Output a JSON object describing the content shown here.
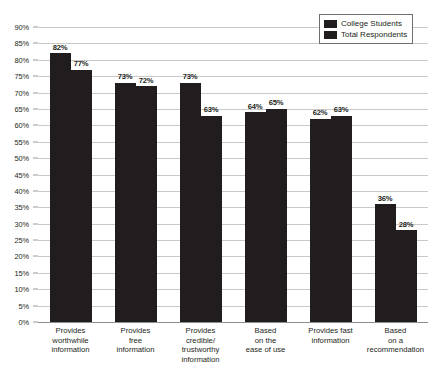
{
  "chart_data": {
    "type": "bar",
    "title": "",
    "subtitle": "",
    "xlabel": "",
    "ylabel": "",
    "ylim": [
      0,
      90
    ],
    "ytick_step": 5,
    "ytick_labels": [
      "90%",
      "85%",
      "80%",
      "75%",
      "70%",
      "65%",
      "60%",
      "55%",
      "50%",
      "45%",
      "40%",
      "35%",
      "30%",
      "25%",
      "20%",
      "15%",
      "10%",
      "5%",
      "0%"
    ],
    "grid": true,
    "legend_position": "top-right",
    "value_suffix": "%",
    "categories": [
      "Provides worthwhile information",
      "Provides free information",
      "Provides credible/ trustworthy information",
      "Based on the ease of use",
      "Provides fast information",
      "Based on a recommendation"
    ],
    "category_lines": [
      [
        "Provides",
        "worthwhile",
        "information"
      ],
      [
        "Provides",
        "free",
        "information"
      ],
      [
        "Provides",
        "credible/",
        "trustworthy",
        "information"
      ],
      [
        "Based",
        "on the",
        "ease of use"
      ],
      [
        "Provides fast",
        "information"
      ],
      [
        "Based",
        "on a",
        "recommendation"
      ]
    ],
    "series": [
      {
        "name": "College Students",
        "color": "#211d1e",
        "values": [
          82,
          73,
          73,
          64,
          62,
          36
        ],
        "labels": [
          "82%",
          "73%",
          "73%",
          "64%",
          "62%",
          "36%"
        ]
      },
      {
        "name": "Total Respondents",
        "color": "#211d1e",
        "values": [
          77,
          72,
          63,
          65,
          63,
          28
        ],
        "labels": [
          "77%",
          "72%",
          "63%",
          "65%",
          "63%",
          "28%"
        ]
      }
    ]
  },
  "colors": {
    "bar": "#211d1e",
    "gridline": "#c9c9c9",
    "axis": "#8d8d8d",
    "text": "#231f20",
    "legend_border": "#6f6f6f",
    "background": "#ffffff"
  }
}
